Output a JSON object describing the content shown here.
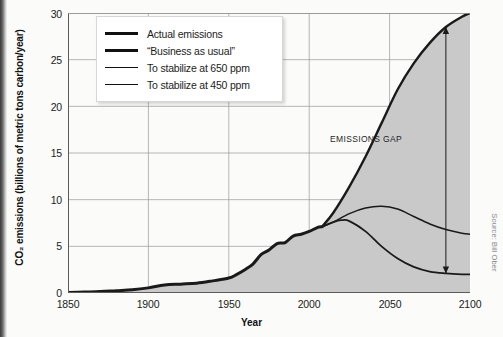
{
  "chart_data": {
    "type": "area",
    "title": "",
    "xlabel": "Year",
    "ylabel": "CO2 emissions (billions of metric tons carbon/year)",
    "ylabel_display": "CO₂ emissions (billions of metric tons carbon/year)",
    "xlim": [
      1850,
      2100
    ],
    "ylim": [
      0,
      30
    ],
    "xticks": [
      1850,
      1900,
      1950,
      2000,
      2050,
      2100
    ],
    "yticks": [
      0,
      5,
      10,
      15,
      20,
      25,
      30
    ],
    "grid": true,
    "legend_position": "top-left-inside",
    "fill_color": "#c9c9c9",
    "line_color": "#1a1a1a",
    "grid_color": "#9a9a9a",
    "series": [
      {
        "name": "Actual emissions",
        "line_width": 3.0,
        "x": [
          1850,
          1860,
          1870,
          1880,
          1890,
          1900,
          1910,
          1920,
          1930,
          1940,
          1950,
          1955,
          1960,
          1965,
          1970,
          1975,
          1980,
          1985,
          1990,
          1995,
          2000,
          2005,
          2008
        ],
        "values": [
          0.05,
          0.1,
          0.15,
          0.25,
          0.35,
          0.55,
          0.85,
          0.95,
          1.05,
          1.3,
          1.6,
          2.0,
          2.5,
          3.1,
          4.1,
          4.6,
          5.3,
          5.4,
          6.1,
          6.3,
          6.6,
          7.0,
          7.1
        ]
      },
      {
        "name": "“Business as usual”",
        "line_width": 2.4,
        "x": [
          2008,
          2015,
          2025,
          2035,
          2045,
          2055,
          2065,
          2075,
          2085,
          2095,
          2100
        ],
        "values": [
          7.1,
          8.6,
          11.4,
          14.6,
          18.2,
          21.8,
          24.6,
          26.8,
          28.5,
          29.6,
          30.0
        ]
      },
      {
        "name": "To stabilize at 650 ppm",
        "line_width": 1.5,
        "x": [
          2008,
          2015,
          2025,
          2035,
          2045,
          2055,
          2065,
          2075,
          2085,
          2095,
          2100
        ],
        "values": [
          7.1,
          7.6,
          8.5,
          9.1,
          9.3,
          9.0,
          8.2,
          7.4,
          6.8,
          6.4,
          6.3
        ]
      },
      {
        "name": "To stabilize at 450 ppm",
        "line_width": 1.8,
        "x": [
          2008,
          2015,
          2020,
          2025,
          2035,
          2045,
          2055,
          2065,
          2075,
          2085,
          2095,
          2100
        ],
        "values": [
          7.1,
          7.6,
          7.8,
          7.7,
          6.6,
          5.0,
          3.7,
          2.8,
          2.3,
          2.1,
          2.0,
          2.0
        ]
      }
    ],
    "annotations": [
      {
        "text": "EMISSIONS GAP",
        "type": "double-headed-arrow",
        "x": 2085,
        "y_top": 28.5,
        "y_bottom": 2.1
      }
    ]
  },
  "legend": {
    "items": [
      {
        "label": "Actual emissions"
      },
      {
        "label": "“Business as usual”"
      },
      {
        "label": "To stabilize at 650 ppm"
      },
      {
        "label": "To stabilize at 450 ppm"
      }
    ]
  },
  "axes": {
    "x_title": "Year",
    "y_title": "CO₂ emissions (billions of metric tons carbon/year)",
    "y_ticks": [
      "0",
      "5",
      "10",
      "15",
      "20",
      "25",
      "30"
    ],
    "x_ticks": [
      "1850",
      "1900",
      "1950",
      "2000",
      "2050",
      "2100"
    ]
  },
  "annotation": {
    "emissions_gap": "EMISSIONS GAP"
  },
  "credit": {
    "source": "Source: Bill Ober"
  }
}
